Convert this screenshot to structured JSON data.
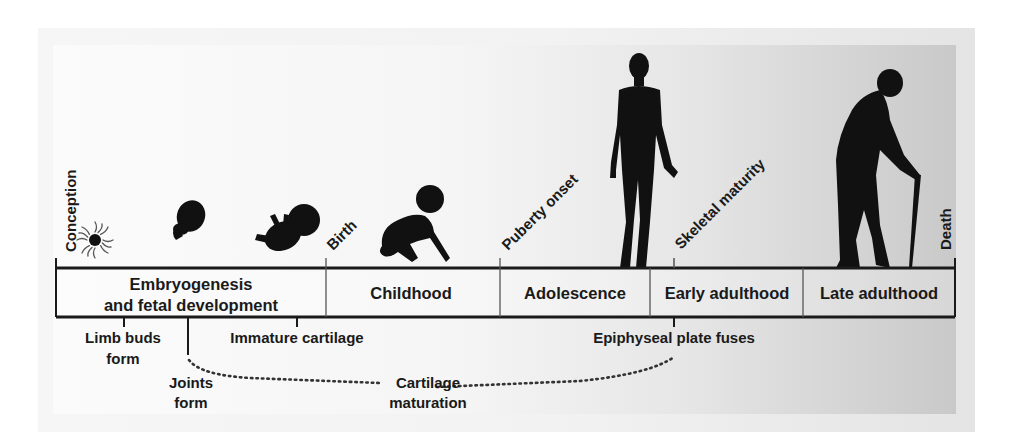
{
  "milestones": [
    {
      "label": "Conception"
    },
    {
      "label": "Birth"
    },
    {
      "label": "Puberty onset"
    },
    {
      "label": "Skeletal maturity"
    },
    {
      "label": "Death"
    }
  ],
  "stages": [
    {
      "line1": "Embryogenesis",
      "line2": "and fetal development"
    },
    {
      "line1": "Childhood"
    },
    {
      "line1": "Adolescence"
    },
    {
      "line1": "Early adulthood"
    },
    {
      "line1": "Late adulthood"
    }
  ],
  "events": [
    {
      "line1": "Limb buds",
      "line2": "form"
    },
    {
      "line1": "Joints",
      "line2": "form"
    },
    {
      "line1": "Immature cartilage"
    },
    {
      "line1": "Epiphyseal plate fuses"
    }
  ],
  "process": {
    "line1": "Cartilage",
    "line2": "maturation"
  },
  "figures": [
    "zygote-icon",
    "embryo-icon",
    "fetus-icon",
    "infant-icon",
    "adult-icon",
    "elderly-icon"
  ],
  "colors": {
    "ink": "#1a1a1a",
    "divider": "#555555"
  }
}
